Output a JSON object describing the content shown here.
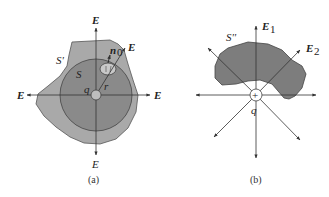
{
  "figure": {
    "panel_a": {
      "caption": "(a)",
      "labels": {
        "field_top": "E",
        "field_bottom": "E",
        "field_left": "E",
        "field_right": "E",
        "field_diag": "E",
        "outer_surface": "S'",
        "inner_surface": "S",
        "charge": "q",
        "radius": "r",
        "normal": "n",
        "normal_sub": "0"
      },
      "colors": {
        "outer_fill": "#a9a9a9",
        "inner_fill": "#8a8a8a",
        "patch_fill": "#c8c8c8",
        "charge_fill": "#bdbdbd"
      }
    },
    "panel_b": {
      "caption": "(b)",
      "labels": {
        "field_1": "E",
        "field_1_sub": "1",
        "field_2": "E",
        "field_2_sub": "2",
        "surface": "S''",
        "charge": "q",
        "charge_sign": "+"
      },
      "colors": {
        "surface_fill": "#7d7d7d",
        "charge_fill": "#ffffff"
      }
    }
  }
}
